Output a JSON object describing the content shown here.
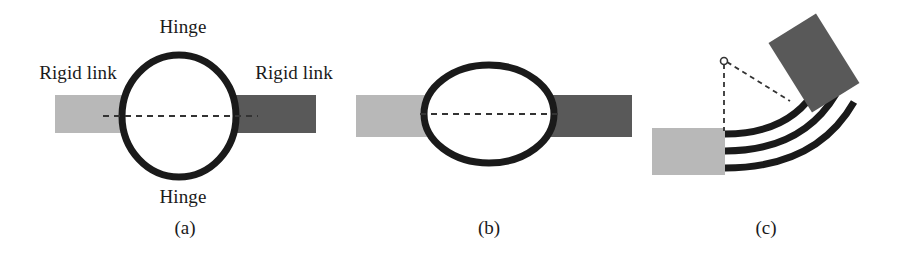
{
  "figure": {
    "background": "#ffffff",
    "width": 897,
    "height": 257,
    "palette": {
      "rigid_link_light": "#b8b8b8",
      "rigid_link_dark": "#595959",
      "flexure_stroke": "#1a1a1a",
      "dashed_line": "#333333",
      "text": "#1a1a1a"
    }
  },
  "panels": [
    {
      "id": "a",
      "caption": "(a)",
      "caption_x": 185,
      "caption_y": 234,
      "labels": [
        {
          "name": "hinge-top",
          "text": "Hinge",
          "x": 183,
          "y": 33
        },
        {
          "name": "hinge-bottom",
          "text": "Hinge",
          "x": 183,
          "y": 203
        },
        {
          "name": "rigid-link-left",
          "text": "Rigid link",
          "x": 78,
          "y": 79
        },
        {
          "name": "rigid-link-right",
          "text": "Rigid link",
          "x": 294,
          "y": 79
        }
      ],
      "links": [
        {
          "name": "rigid-link-left-bar",
          "x": 55,
          "y": 95,
          "w": 78,
          "h": 38,
          "color": "#b8b8b8"
        },
        {
          "name": "rigid-link-right-bar",
          "x": 226,
          "y": 95,
          "w": 90,
          "h": 38,
          "color": "#595959"
        }
      ],
      "compliant_member": {
        "name": "circular-flexure-ring",
        "shape": "circle",
        "cx": 179,
        "cy": 116,
        "rx": 57,
        "ry": 61,
        "stroke_width": 7
      },
      "centerline": {
        "name": "centerline-dashed",
        "x1": 103,
        "y1": 116,
        "x2": 258,
        "y2": 116
      }
    },
    {
      "id": "b",
      "caption": "(b)",
      "caption_x": 489,
      "caption_y": 234,
      "labels": [],
      "links": [
        {
          "name": "rigid-link-left-bar",
          "x": 356,
          "y": 95,
          "w": 80,
          "h": 42,
          "color": "#b8b8b8"
        },
        {
          "name": "rigid-link-right-bar",
          "x": 540,
          "y": 95,
          "w": 92,
          "h": 42,
          "color": "#595959"
        }
      ],
      "compliant_member": {
        "name": "elliptical-flexure-ring",
        "shape": "ellipse",
        "cx": 489,
        "cy": 114,
        "rx": 65,
        "ry": 49,
        "stroke_width": 7
      },
      "centerline": {
        "name": "centerline-dashed",
        "x1": 420,
        "y1": 114,
        "x2": 558,
        "y2": 114
      }
    },
    {
      "id": "c",
      "caption": "(c)",
      "caption_x": 766,
      "caption_y": 234,
      "labels": [],
      "links": [
        {
          "name": "rigid-link-fixed-bar",
          "x": 652,
          "y": 128,
          "w": 73,
          "h": 47,
          "color": "#b8b8b8",
          "rotation": 0
        },
        {
          "name": "rigid-link-rotated-bar",
          "x": 786,
          "y": 22,
          "w": 56,
          "h": 82,
          "color": "#595959",
          "rotation": -32
        }
      ],
      "flexures": {
        "name": "compliant-beam-arcs",
        "count": 3,
        "stroke_width": 7,
        "paths": [
          "M 725 134 C 768 134 800 118 818 86",
          "M 725 151 C 778 151 814 131 836 94",
          "M 725 168 C 788 168 830 144 854 102"
        ]
      },
      "pivot": {
        "name": "virtual-pivot-point",
        "cx": 724,
        "cy": 61,
        "r": 3.5
      },
      "dashed_lines": [
        {
          "name": "pivot-vertical-dashed",
          "x1": 724,
          "y1": 64,
          "x2": 724,
          "y2": 131
        },
        {
          "name": "pivot-diagonal-dashed",
          "x1": 727,
          "y1": 62,
          "x2": 790,
          "y2": 101
        }
      ]
    }
  ]
}
